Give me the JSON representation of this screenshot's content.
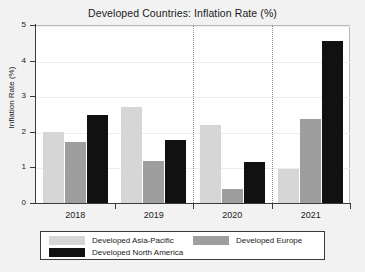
{
  "chart_data": {
    "type": "bar",
    "title": "Developed Countries: Inflation Rate (%)",
    "xlabel": "",
    "ylabel": "Inflation Rate (%)",
    "categories": [
      "2018",
      "2019",
      "2020",
      "2021"
    ],
    "series": [
      {
        "name": "Developed Asia-Pacific",
        "color": "#d6d6d6",
        "values": [
          2.0,
          2.7,
          2.2,
          0.95
        ]
      },
      {
        "name": "Developed Europe",
        "color": "#9e9e9e",
        "values": [
          1.7,
          1.18,
          0.4,
          2.35
        ]
      },
      {
        "name": "Developed North America",
        "color": "#111111",
        "values": [
          2.47,
          1.78,
          1.15,
          4.55
        ]
      }
    ],
    "ylim": [
      0,
      5
    ],
    "yticks": [
      "0",
      "1",
      "2",
      "3",
      "4",
      "5"
    ],
    "grid": true,
    "legend_position": "bottom",
    "annotations": [
      {
        "type": "vertical-dotted-line",
        "at": "between-2019-and-2020"
      },
      {
        "type": "vertical-dotted-line",
        "at": "between-2020-and-2021"
      }
    ]
  },
  "legend": {
    "entries": [
      {
        "label": "Developed Asia-Pacific"
      },
      {
        "label": "Developed Europe"
      },
      {
        "label": "Developed North America"
      }
    ]
  }
}
